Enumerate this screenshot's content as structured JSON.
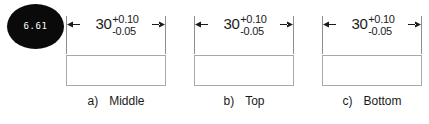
{
  "badge": {
    "name": "measurement-annotation-badge",
    "value": "6.61",
    "background_color": "#0a0a0a",
    "text_color": "#ffffff"
  },
  "diagram": {
    "type": "engineering-dimension-drawing",
    "line_color": "#8d8d8d",
    "rect_border_color": "#a8a8a8",
    "text_color": "#1a1a1a",
    "groups": [
      {
        "key": "a)",
        "caption": "Middle",
        "dimension": {
          "nominal": "30",
          "upper_tolerance": "+0.10",
          "lower_tolerance": "-0.05"
        }
      },
      {
        "key": "b)",
        "caption": "Top",
        "dimension": {
          "nominal": "30",
          "upper_tolerance": "+0.10",
          "lower_tolerance": "-0.05"
        }
      },
      {
        "key": "c)",
        "caption": "Bottom",
        "dimension": {
          "nominal": "30",
          "upper_tolerance": "+0.10",
          "lower_tolerance": "-0.05"
        }
      }
    ]
  }
}
